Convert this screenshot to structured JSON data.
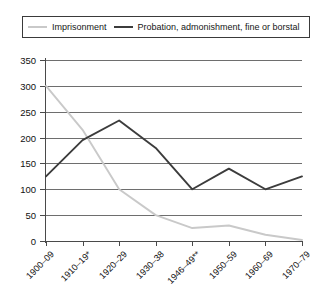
{
  "legend": {
    "entries": [
      {
        "label": "Imprisonment",
        "color": "#c9c9c9",
        "key": "imprisonment"
      },
      {
        "label": "Probation, admonishment, fine or borstal",
        "color": "#3c3c3c",
        "key": "probation"
      }
    ]
  },
  "chart_data": {
    "type": "line",
    "title": "",
    "xlabel": "",
    "ylabel": "",
    "ylim": [
      0,
      350
    ],
    "ytick_step": 50,
    "yticks": [
      0,
      50,
      100,
      150,
      200,
      250,
      300,
      350
    ],
    "ytick_labels": [
      "0",
      "50",
      "100",
      "150",
      "200",
      "250",
      "300",
      "350"
    ],
    "grid": true,
    "legend_position": "top",
    "categories": [
      "1900–09",
      "1910–19*",
      "1920–29",
      "1930–38",
      "1946–49**",
      "1950–59",
      "1960–69",
      "1970–79"
    ],
    "series": [
      {
        "name": "Imprisonment",
        "color": "#c9c9c9",
        "values": [
          300,
          215,
          100,
          50,
          25,
          30,
          12,
          2
        ]
      },
      {
        "name": "Probation, admonishment, fine or borstal",
        "color": "#3c3c3c",
        "values": [
          125,
          195,
          233,
          180,
          100,
          140,
          100,
          125
        ]
      }
    ]
  }
}
